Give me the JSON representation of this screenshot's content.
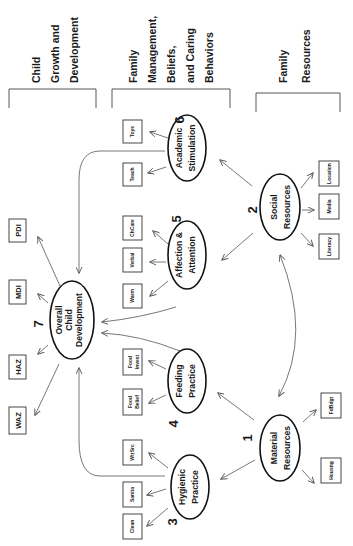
{
  "headers": {
    "child": [
      "Child",
      "Growth and",
      "Development"
    ],
    "family_mgmt": [
      "Family",
      "Management,",
      "Beliefs,",
      "and Caring",
      "Behaviors"
    ],
    "family_res": [
      "Family",
      "Resources"
    ]
  },
  "nodes": {
    "overall": {
      "number": "7",
      "lines": [
        "Overall",
        "Child",
        "Development"
      ]
    },
    "hygienic": {
      "number": "3",
      "lines": [
        "Hygienic",
        "Practice"
      ]
    },
    "feeding": {
      "number": "4",
      "lines": [
        "Feeding",
        "Practice"
      ]
    },
    "affection": {
      "number": "5",
      "lines": [
        "Affection &",
        "Attention"
      ]
    },
    "academic": {
      "number": "6",
      "lines": [
        "Academic",
        "Stimulation"
      ]
    },
    "material": {
      "number": "1",
      "lines": [
        "Material",
        "Resources"
      ]
    },
    "social": {
      "number": "2",
      "lines": [
        "Social",
        "Resources"
      ]
    }
  },
  "outcomes": [
    "WAZ",
    "HAZ",
    "MDI",
    "PDI"
  ],
  "indicators": {
    "hygienic": [
      "Clean",
      "Sanita",
      "WtrSrc"
    ],
    "feeding": [
      [
        "Food",
        "Belief"
      ],
      [
        "Food",
        "Invest"
      ]
    ],
    "affection": [
      "Warm",
      "Verbal",
      "ChCare"
    ],
    "academic": [
      "Teach",
      "Toys"
    ],
    "material": [
      "Housng",
      "FdBdgt"
    ],
    "social": [
      "Literacy",
      "Media",
      "Location"
    ]
  }
}
